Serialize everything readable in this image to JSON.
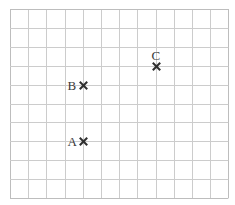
{
  "diagram": {
    "type": "grid-with-points",
    "grid": {
      "columns": 12,
      "rows": 10,
      "left": 10,
      "top": 9,
      "cell_width": 18.2,
      "cell_height": 18.9,
      "line_color": "#cccccc",
      "border_color": "#bdbdbd"
    },
    "marker_color": "#2f2f2f",
    "label_color": "#3a3a3a",
    "points": [
      {
        "label": "A",
        "col": 4,
        "row": 7,
        "label_position": "left"
      },
      {
        "label": "B",
        "col": 4,
        "row": 4,
        "label_position": "left"
      },
      {
        "label": "C",
        "col": 8,
        "row": 3,
        "label_position": "above"
      }
    ]
  }
}
